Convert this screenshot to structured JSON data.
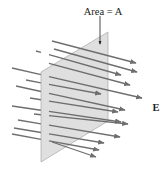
{
  "diagram": {
    "area_label": "Area = A",
    "field_label": "E",
    "colors": {
      "plane_fill": "#dcdcdc",
      "plane_stroke": "#9a9a9a",
      "arrow": "#6e6e6e",
      "text": "#222222"
    },
    "plane": {
      "points": [
        [
          41,
          72
        ],
        [
          108,
          32
        ],
        [
          108,
          121
        ],
        [
          41,
          162
        ]
      ]
    },
    "area_pointer": {
      "x": 100,
      "y1": 16,
      "y2": 44
    },
    "arrows": [
      {
        "x1": 52,
        "y1": 41,
        "x2": 136,
        "y2": 63
      },
      {
        "x1": 54,
        "y1": 49,
        "x2": 137,
        "y2": 72
      },
      {
        "x1": 36,
        "y1": 51,
        "x2": 121,
        "y2": 75
      },
      {
        "x1": 44,
        "y1": 62,
        "x2": 130,
        "y2": 85
      },
      {
        "x1": 12,
        "y1": 68,
        "x2": 142,
        "y2": 98
      },
      {
        "x1": 26,
        "y1": 80,
        "x2": 101,
        "y2": 94
      },
      {
        "x1": 16,
        "y1": 86,
        "x2": 125,
        "y2": 110
      },
      {
        "x1": 30,
        "y1": 98,
        "x2": 118,
        "y2": 112
      },
      {
        "x1": 12,
        "y1": 106,
        "x2": 121,
        "y2": 122
      },
      {
        "x1": 34,
        "y1": 114,
        "x2": 128,
        "y2": 124
      },
      {
        "x1": 18,
        "y1": 120,
        "x2": 120,
        "y2": 137
      },
      {
        "x1": 14,
        "y1": 128,
        "x2": 104,
        "y2": 143
      },
      {
        "x1": 12,
        "y1": 134,
        "x2": 99,
        "y2": 150
      },
      {
        "x1": 52,
        "y1": 142,
        "x2": 96,
        "y2": 157
      }
    ]
  }
}
